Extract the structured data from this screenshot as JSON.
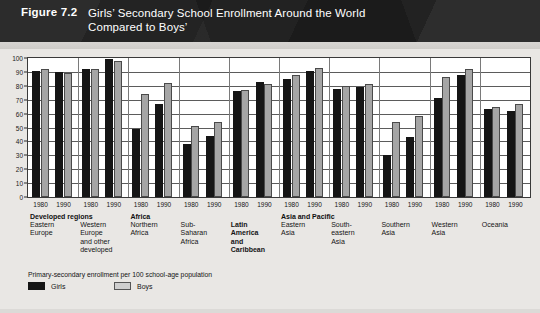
{
  "figure": {
    "number_label": "Figure 7.2",
    "title_line1": "Girls’ Secondary School Enrollment Around the World",
    "title_line2": "Compared to Boys’"
  },
  "legend": {
    "note": "Primary-secondary enrollment per 100 school-age population",
    "items": [
      {
        "label": "Girls",
        "color": "#151515"
      },
      {
        "label": "Boys",
        "color": "#cfcfcf"
      }
    ]
  },
  "axis": {
    "y_ticks": [
      "100",
      "90",
      "80",
      "70",
      "60",
      "50",
      "40",
      "30",
      "20",
      "10",
      "0"
    ],
    "x_year_labels": [
      "1980",
      "1990"
    ]
  },
  "supergroups": [
    {
      "name": "Developed regions",
      "start_region": 0,
      "bold": true
    },
    {
      "name": "Africa",
      "start_region": 2,
      "bold": true
    },
    {
      "name": "Asia and Pacific",
      "start_region": 5,
      "bold": true
    }
  ],
  "chart_data": {
    "type": "bar",
    "title": "Girls’ Secondary School Enrollment Around the World Compared to Boys’",
    "xlabel": "",
    "ylabel": "Primary-secondary enrollment per 100 school-age population",
    "ylim": [
      0,
      100
    ],
    "ytick_step": 10,
    "grid": true,
    "legend_position": "bottom-left",
    "categories": [
      "Eastern Europe 1980",
      "Eastern Europe 1990",
      "Western Europe and other developed 1980",
      "Western Europe and other developed 1990",
      "Northern Africa 1980",
      "Northern Africa 1990",
      "Sub-Saharan Africa 1980",
      "Sub-Saharan Africa 1990",
      "Latin America and Caribbean 1980",
      "Latin America and Caribbean 1990",
      "Eastern Asia 1980",
      "Eastern Asia 1990",
      "South-eastern Asia 1980",
      "South-eastern Asia 1990",
      "Southern Asia 1980",
      "Southern Asia 1990",
      "Western Asia 1980",
      "Western Asia 1990",
      "Oceania 1980",
      "Oceania 1990"
    ],
    "series": [
      {
        "name": "Girls",
        "color": "#151515",
        "values": [
          91,
          90,
          92,
          99,
          49,
          67,
          38,
          44,
          76,
          83,
          85,
          91,
          78,
          79,
          30,
          43,
          71,
          88,
          63,
          62
        ]
      },
      {
        "name": "Boys",
        "color": "#a5a5a5",
        "values": [
          92,
          89,
          92,
          98,
          74,
          82,
          51,
          54,
          77,
          81,
          88,
          93,
          80,
          81,
          54,
          58,
          86,
          92,
          65,
          67
        ]
      }
    ],
    "regions": [
      {
        "name": "Eastern\nEurope",
        "bold": false
      },
      {
        "name": "Western\nEurope\nand other\ndeveloped",
        "bold": false
      },
      {
        "name": "Northern\nAfrica",
        "bold": false
      },
      {
        "name": "Sub-\nSaharan\nAfrica",
        "bold": false
      },
      {
        "name": "Latin\nAmerica\nand\nCaribbean",
        "bold": true
      },
      {
        "name": "Eastern\nAsia",
        "bold": false
      },
      {
        "name": "South-\neastern\nAsia",
        "bold": false
      },
      {
        "name": "Southern\nAsia",
        "bold": false
      },
      {
        "name": "Western\nAsia",
        "bold": false
      },
      {
        "name": "Oceania",
        "bold": false
      }
    ]
  }
}
